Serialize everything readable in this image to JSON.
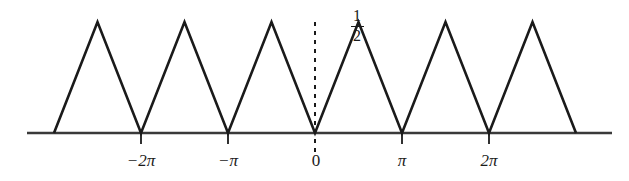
{
  "figure": {
    "title": "",
    "background_color": "#ffffff",
    "line_color": "#1a1a1a",
    "axis_color": "#3a3a3a"
  },
  "labels": {
    "amplitude": {
      "numerator": "1",
      "denominator": "2",
      "text": "1/2"
    },
    "ticks": [
      {
        "text": "−2π",
        "value": -2,
        "x": 141
      },
      {
        "text": "−π",
        "value": -1,
        "x": 228
      },
      {
        "text": "0",
        "value": 0,
        "x": 315
      },
      {
        "text": "π",
        "value": 1,
        "x": 402
      },
      {
        "text": "2π",
        "value": 2,
        "x": 489
      }
    ]
  },
  "chart_data": {
    "type": "line",
    "title": "",
    "xlabel": "",
    "ylabel": "",
    "amplitude": 0.5,
    "period_in_pi": 2,
    "xlim_in_pi": [
      -3.3,
      3.4
    ],
    "ylim": [
      0,
      0.62
    ],
    "grid": false,
    "legend": null,
    "xticks_in_pi": [
      -2,
      -1,
      0,
      1,
      2
    ],
    "xtick_labels": [
      "−2π",
      "−π",
      "0",
      "π",
      "2π"
    ],
    "vertex_points_in_pi": [
      {
        "x": -3.0,
        "y": 0.0
      },
      {
        "x": -2.5,
        "y": 0.5
      },
      {
        "x": -2.0,
        "y": 0.0
      },
      {
        "x": -1.5,
        "y": 0.5
      },
      {
        "x": -1.0,
        "y": 0.0
      },
      {
        "x": -0.5,
        "y": 0.5
      },
      {
        "x": 0.0,
        "y": 0.0
      },
      {
        "x": 0.5,
        "y": 0.5
      },
      {
        "x": 1.0,
        "y": 0.0
      },
      {
        "x": 1.5,
        "y": 0.5
      },
      {
        "x": 2.0,
        "y": 0.0
      },
      {
        "x": 2.5,
        "y": 0.5
      },
      {
        "x": 3.0,
        "y": 0.0
      }
    ],
    "annotations": [
      {
        "type": "dashed-vline",
        "x_in_pi": 0,
        "label": "1/2",
        "from_y": 0.62,
        "to_y": -0.16
      }
    ]
  },
  "geometry": {
    "axis_y": 133,
    "axis_x_start": 27,
    "axis_x_end": 612,
    "peak_y": 22,
    "pi_px": 87,
    "origin_x": 315,
    "tick_length": 11,
    "dash_top_y": 22,
    "dash_bottom_y": 154,
    "curve_points": "54,133 97.5,22 141,133 184.5,22 228,133 271.5,22 315,133 358.5,22 402,133 445.5,22 489,133 532.5,22 576,133",
    "stroke_width": 2.6
  }
}
